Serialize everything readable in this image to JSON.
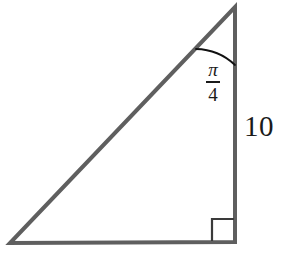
{
  "figure": {
    "kind": "right-triangle-diagram",
    "background_color": "#ffffff",
    "stroke_color": "#5f5f5f",
    "text_color": "#1a1a1a",
    "arc_color": "#111111",
    "stroke_width": 4,
    "arc_stroke_width": 1.8,
    "right_angle_stroke_width": 2.2
  },
  "geometry": {
    "vertices": {
      "top": {
        "x": 235,
        "y": 7
      },
      "bottom_right": {
        "x": 235,
        "y": 242
      },
      "bottom_left": {
        "x": 10,
        "y": 243
      }
    },
    "right_angle_marker": {
      "x": 212,
      "y": 219,
      "size": 22
    },
    "angle_arc": {
      "center_x": 235,
      "center_y": 7,
      "radius": 58,
      "start_x": 196,
      "start_y": 49,
      "end_x": 235,
      "end_y": 65,
      "sweep_degrees": 45
    }
  },
  "labels": {
    "angle": {
      "numerator": "π",
      "denominator": "4",
      "value_text": "π/4",
      "meaning": "angle at top vertex"
    },
    "side_length": {
      "text": "10",
      "meaning": "length of the vertical right-hand side"
    }
  }
}
